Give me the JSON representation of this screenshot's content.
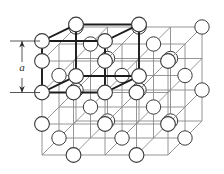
{
  "figure": {
    "kind": "crystal-lattice-diagram",
    "width": 224,
    "height": 174,
    "background_color": "#ffffff"
  },
  "annotations": {
    "lattice_constant_label": "a"
  },
  "style": {
    "grid_line_color": "#8a8a8a",
    "unit_cell_line_color": "#1c1c1c",
    "atom_stroke_color": "#3a3a3a",
    "atom_fill_color": "#ffffff",
    "dimension_line_color": "#2b2b2b",
    "grid_line_width": 0.9,
    "unit_cell_line_width": 1.9,
    "atom_stroke_width": 1.0,
    "atom_radius": 7.2
  },
  "geometry": {
    "origin_x": 42,
    "origin_y": 155,
    "step_x": 31.5,
    "step_y": 31.5,
    "depth_dx": 17,
    "depth_dy": -17,
    "cols": 5,
    "rows": 4,
    "planes": 3
  },
  "dimension": {
    "axis_x": 22,
    "top_y": 42,
    "bottom_y": 92,
    "tick_left_x": 10,
    "tick_right_x": 40,
    "label_x": 22,
    "label_y": 70
  },
  "unit_cell": {
    "front_left_x": 42,
    "front_top_y": 92,
    "size": 63,
    "depth_dx": 34,
    "depth_dy": -34
  }
}
